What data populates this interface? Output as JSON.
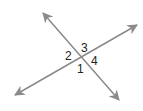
{
  "diagram": {
    "line_color": "#8a8a8a",
    "lines": [
      {
        "name": "line-a",
        "x1": 43,
        "y1": 13,
        "x2": 119,
        "y2": 100
      },
      {
        "name": "line-b",
        "x1": 15,
        "y1": 95,
        "x2": 137,
        "y2": 25
      }
    ],
    "labels": [
      {
        "text": "3",
        "x": 81,
        "y": 52
      },
      {
        "text": "2",
        "x": 65,
        "y": 60
      },
      {
        "text": "4",
        "x": 91,
        "y": 65
      },
      {
        "text": "1",
        "x": 77,
        "y": 73
      }
    ]
  }
}
